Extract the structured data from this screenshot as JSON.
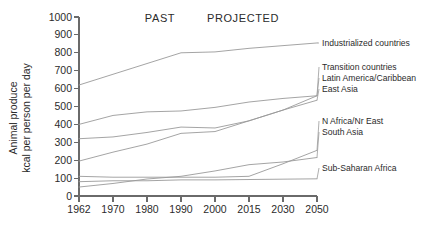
{
  "chart_data": {
    "type": "line",
    "title": "",
    "xlabel": "",
    "ylabel": "Animal produce\nkcal per person per day",
    "ylabel_line1": "Animal produce",
    "ylabel_line2": "kcal per person per day",
    "x": [
      1962,
      1970,
      1980,
      1990,
      2000,
      2015,
      2030,
      2050
    ],
    "xlim": [
      1962,
      2050
    ],
    "ylim": [
      0,
      1000
    ],
    "ytick_values": [
      0,
      100,
      200,
      300,
      400,
      500,
      600,
      700,
      800,
      900,
      1000
    ],
    "ytick_labels": [
      "0",
      "100",
      "200",
      "300",
      "400",
      "500",
      "600",
      "700",
      "800",
      "900",
      "1000"
    ],
    "xtick_labels": [
      "1962",
      "1970",
      "1980",
      "1990",
      "2000",
      "2015",
      "2030",
      "2050"
    ],
    "grid": false,
    "legend_position": "right-inline-labels",
    "line_color": "#9a9a9a",
    "axis_color": "#6a6a6a",
    "text_color": "#2b2b2b",
    "annotations": [
      {
        "name": "past-label",
        "text": "PAST",
        "x": 1983,
        "y": 985
      },
      {
        "name": "projected-label",
        "text": "PROJECTED",
        "x": 2011,
        "y": 985
      }
    ],
    "series": [
      {
        "name": "Industrialized countries",
        "label": "Industrialized countries",
        "values": [
          620,
          680,
          740,
          800,
          805,
          825,
          840,
          855
        ]
      },
      {
        "name": "Transition countries",
        "label": "Transition countries",
        "values": [
          195,
          245,
          290,
          350,
          360,
          420,
          480,
          560
        ]
      },
      {
        "name": "Latin America/Caribbean",
        "label": "Latin America/Caribbean",
        "values": [
          400,
          450,
          470,
          475,
          495,
          525,
          545,
          560
        ]
      },
      {
        "name": "East Asia",
        "label": "East Asia",
        "values": [
          320,
          330,
          355,
          385,
          380,
          420,
          480,
          535
        ]
      },
      {
        "name": "N Africa/Nr East",
        "label": "N Africa/Nr East",
        "values": [
          110,
          105,
          105,
          105,
          105,
          110,
          180,
          255
        ]
      },
      {
        "name": "South Asia",
        "label": "South Asia",
        "values": [
          50,
          70,
          95,
          110,
          140,
          175,
          190,
          215
        ]
      },
      {
        "name": "Sub-Saharan Africa",
        "label": "Sub-Saharan Africa",
        "values": [
          80,
          85,
          85,
          90,
          90,
          92,
          94,
          96
        ]
      }
    ],
    "series_labels_layout": [
      {
        "series": "Industrialized countries",
        "label_y": 43
      },
      {
        "series": "Transition countries",
        "label_y": 67
      },
      {
        "series": "Latin America/Caribbean",
        "label_y": 78
      },
      {
        "series": "East Asia",
        "label_y": 89
      },
      {
        "series": "N Africa/Nr East",
        "label_y": 121
      },
      {
        "series": "South Asia",
        "label_y": 132
      },
      {
        "series": "Sub-Saharan Africa",
        "label_y": 168
      }
    ]
  }
}
